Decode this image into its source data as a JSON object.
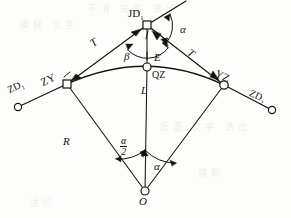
{
  "figure": {
    "type": "circular-curve-survey-diagram",
    "ink_color": "#15130f",
    "paper_color": "#fdfdfb"
  },
  "points": {
    "jd": {
      "label": "JD",
      "sub": "1",
      "x": 147,
      "y": 25,
      "marker": "square"
    },
    "zy": {
      "label": "ZY",
      "x": 67,
      "y": 84,
      "marker": "square"
    },
    "yz": {
      "label": "YZ",
      "x": 224,
      "y": 85,
      "marker": "circle"
    },
    "qz": {
      "label": "QZ",
      "x": 147,
      "y": 67,
      "marker": "circle"
    },
    "o": {
      "label": "O",
      "x": 145,
      "y": 192,
      "marker": "circle"
    },
    "zd1": {
      "label": "ZD",
      "sub": "1",
      "x": 18,
      "y": 107,
      "marker": "circle"
    },
    "zd2": {
      "label": "ZD",
      "sub": "2",
      "x": 272,
      "y": 110,
      "marker": "circle"
    }
  },
  "dimensions": {
    "tangent_left": "T",
    "tangent_right": "T",
    "radius": "R",
    "curve_length": "L",
    "external": "E",
    "angle_alpha_jd": "α",
    "angle_beta": "β",
    "angle_alpha_o": "α",
    "half_alpha_num": "α",
    "half_alpha_den": "2"
  },
  "ghost_text": {
    "t1": "不清 背面 透印",
    "t2": "模糊 文字",
    "t3": "反面 文字 透出",
    "t4": "模糊",
    "t5": "透印"
  }
}
